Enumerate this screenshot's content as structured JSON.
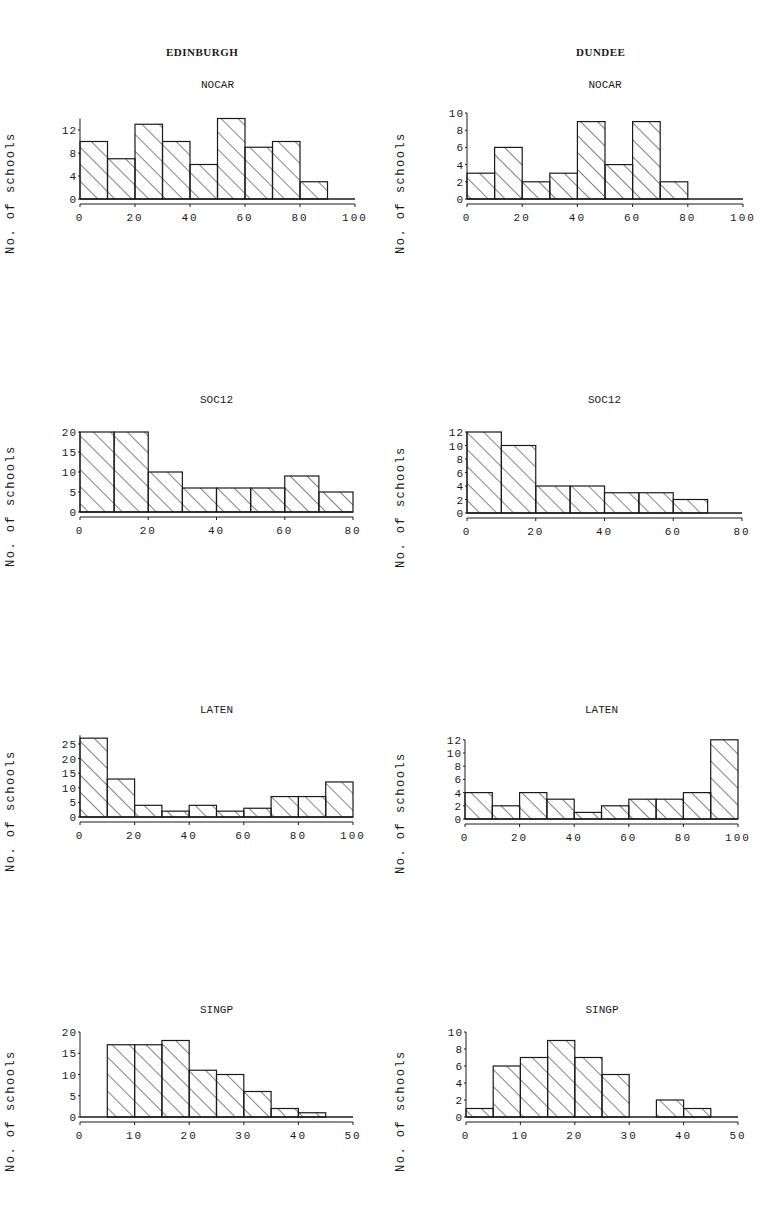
{
  "columns": [
    {
      "id": "edinburgh",
      "title": "EDINBURGH"
    },
    {
      "id": "dundee",
      "title": "DUNDEE"
    }
  ],
  "ylabel": "No. of schools",
  "chart_data": [
    {
      "type": "bar",
      "city": "EDINBURGH",
      "title": "NOCAR",
      "xlabel": "",
      "ylabel": "No. of schools",
      "bin_edges": [
        0,
        10,
        20,
        30,
        40,
        50,
        60,
        70,
        80,
        90,
        100
      ],
      "values": [
        10,
        7,
        13,
        10,
        6,
        14,
        9,
        10,
        3,
        0
      ],
      "xticks": [
        0,
        20,
        40,
        60,
        80,
        100
      ],
      "yticks": [
        0,
        4,
        8,
        12
      ],
      "xlim": [
        0,
        100
      ],
      "ylim": [
        0,
        14
      ],
      "grid": false,
      "hatch": "diagonal"
    },
    {
      "type": "bar",
      "city": "DUNDEE",
      "title": "NOCAR",
      "xlabel": "",
      "ylabel": "No. of schools",
      "bin_edges": [
        0,
        10,
        20,
        30,
        40,
        50,
        60,
        70,
        80,
        90,
        100
      ],
      "values": [
        3,
        6,
        2,
        3,
        9,
        4,
        9,
        2,
        0,
        0
      ],
      "xticks": [
        0,
        20,
        40,
        60,
        80,
        100
      ],
      "yticks": [
        0,
        2,
        4,
        6,
        8,
        10
      ],
      "xlim": [
        0,
        100
      ],
      "ylim": [
        0,
        10
      ],
      "grid": false,
      "hatch": "diagonal"
    },
    {
      "type": "bar",
      "city": "EDINBURGH",
      "title": "SOC12",
      "xlabel": "",
      "ylabel": "No. of schools",
      "bin_edges": [
        0,
        10,
        20,
        30,
        40,
        50,
        60,
        70,
        80
      ],
      "values": [
        20,
        20,
        10,
        6,
        6,
        6,
        9,
        5
      ],
      "xticks": [
        0,
        20,
        40,
        60,
        80
      ],
      "yticks": [
        0,
        5,
        10,
        15,
        20
      ],
      "xlim": [
        0,
        80
      ],
      "ylim": [
        0,
        20
      ],
      "grid": false,
      "hatch": "diagonal"
    },
    {
      "type": "bar",
      "city": "DUNDEE",
      "title": "SOC12",
      "xlabel": "",
      "ylabel": "No. of schools",
      "bin_edges": [
        0,
        10,
        20,
        30,
        40,
        50,
        60,
        70,
        80
      ],
      "values": [
        12,
        10,
        4,
        4,
        3,
        3,
        2,
        0
      ],
      "xticks": [
        0,
        20,
        40,
        60,
        80
      ],
      "yticks": [
        0,
        2,
        4,
        6,
        8,
        10,
        12
      ],
      "xlim": [
        0,
        80
      ],
      "ylim": [
        0,
        12
      ],
      "grid": false,
      "hatch": "diagonal"
    },
    {
      "type": "bar",
      "city": "EDINBURGH",
      "title": "LATEN",
      "xlabel": "",
      "ylabel": "No. of schools",
      "bin_edges": [
        0,
        10,
        20,
        30,
        40,
        50,
        60,
        70,
        80,
        90,
        100
      ],
      "values": [
        27,
        13,
        4,
        2,
        4,
        2,
        3,
        7,
        7,
        12
      ],
      "xticks": [
        0,
        20,
        40,
        60,
        80,
        100
      ],
      "yticks": [
        0,
        5,
        10,
        15,
        20,
        25
      ],
      "xlim": [
        0,
        100
      ],
      "ylim": [
        0,
        28
      ],
      "grid": false,
      "hatch": "diagonal"
    },
    {
      "type": "bar",
      "city": "DUNDEE",
      "title": "LATEN",
      "xlabel": "",
      "ylabel": "No. of schools",
      "bin_edges": [
        0,
        10,
        20,
        30,
        40,
        50,
        60,
        70,
        80,
        90,
        100
      ],
      "values": [
        4,
        2,
        4,
        3,
        1,
        2,
        3,
        3,
        4,
        12
      ],
      "xticks": [
        0,
        20,
        40,
        60,
        80,
        100
      ],
      "yticks": [
        0,
        2,
        4,
        6,
        8,
        10,
        12
      ],
      "xlim": [
        0,
        100
      ],
      "ylim": [
        0,
        12
      ],
      "grid": false,
      "hatch": "diagonal"
    },
    {
      "type": "bar",
      "city": "EDINBURGH",
      "title": "SINGP",
      "xlabel": "",
      "ylabel": "No. of schools",
      "bin_edges": [
        0,
        5,
        10,
        15,
        20,
        25,
        30,
        35,
        40,
        45,
        50
      ],
      "values": [
        0,
        17,
        17,
        18,
        11,
        10,
        6,
        2,
        1,
        0
      ],
      "xticks": [
        0,
        10,
        20,
        30,
        40,
        50
      ],
      "yticks": [
        0,
        5,
        10,
        15,
        20
      ],
      "xlim": [
        0,
        50
      ],
      "ylim": [
        0,
        20
      ],
      "grid": false,
      "hatch": "diagonal"
    },
    {
      "type": "bar",
      "city": "DUNDEE",
      "title": "SINGP",
      "xlabel": "",
      "ylabel": "No. of schools",
      "bin_edges": [
        0,
        5,
        10,
        15,
        20,
        25,
        30,
        35,
        40,
        45,
        50
      ],
      "values": [
        1,
        6,
        7,
        9,
        7,
        5,
        0,
        2,
        1,
        0
      ],
      "xticks": [
        0,
        10,
        20,
        30,
        40,
        50
      ],
      "yticks": [
        0,
        2,
        4,
        6,
        8,
        10
      ],
      "xlim": [
        0,
        50
      ],
      "ylim": [
        0,
        10
      ],
      "grid": false,
      "hatch": "diagonal"
    }
  ],
  "layout": [
    {
      "left": 0,
      "top": 70,
      "x0": 80,
      "x1": 355,
      "y0": 199,
      "ppu": 5.75
    },
    {
      "left": 390,
      "top": 70,
      "x0": 467,
      "x1": 743,
      "y0": 199,
      "ppu": 8.6
    },
    {
      "left": 0,
      "top": 385,
      "x0": 80,
      "x1": 353,
      "y0": 512,
      "ppu": 4.0
    },
    {
      "left": 390,
      "top": 385,
      "x0": 467,
      "x1": 742,
      "y0": 513,
      "ppu": 6.75
    },
    {
      "left": 0,
      "top": 695,
      "x0": 80,
      "x1": 353,
      "y0": 817,
      "ppu": 2.92
    },
    {
      "left": 390,
      "top": 695,
      "x0": 465,
      "x1": 738,
      "y0": 819,
      "ppu": 6.6
    },
    {
      "left": 0,
      "top": 995,
      "x0": 80,
      "x1": 353,
      "y0": 1117,
      "ppu": 4.25
    },
    {
      "left": 390,
      "top": 995,
      "x0": 466,
      "x1": 738,
      "y0": 1117,
      "ppu": 8.5
    }
  ],
  "colors": {
    "ink": "#1a1a1a",
    "paper": "#ffffff"
  }
}
